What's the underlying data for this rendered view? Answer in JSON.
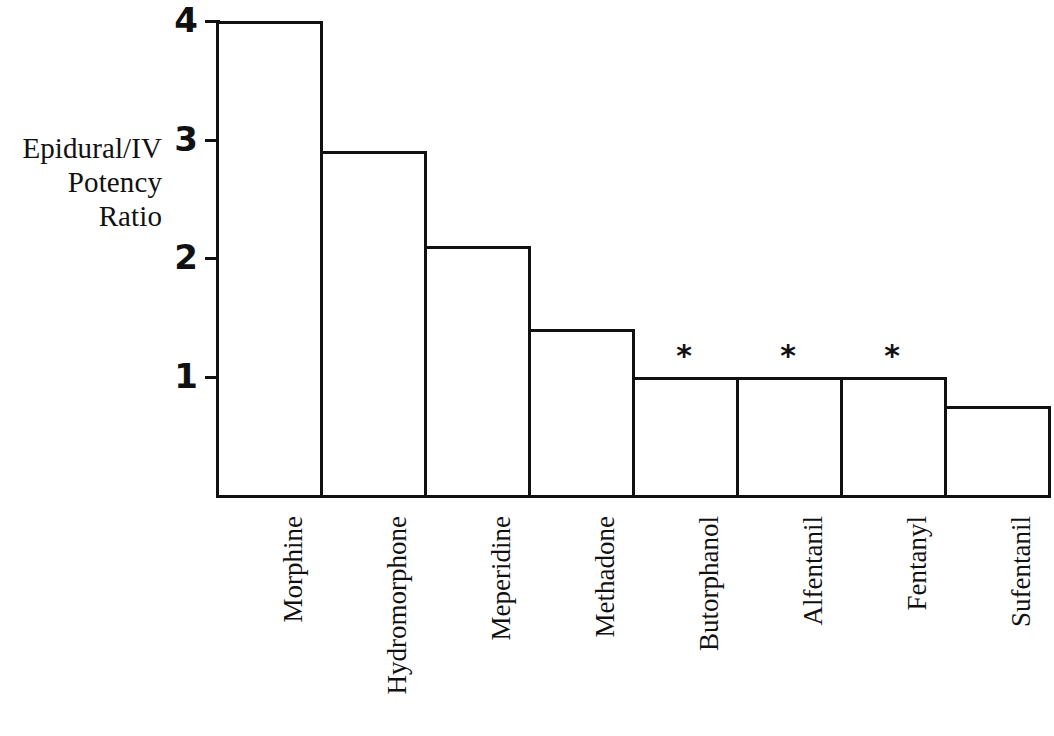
{
  "chart_data": {
    "type": "bar",
    "title": "",
    "subtitle": "",
    "xlabel": "",
    "ylabel": "Epidural/IV Potency Ratio",
    "ylabel_lines": [
      "Epidural/IV",
      "Potency",
      "Ratio"
    ],
    "categories": [
      "Morphine",
      "Hydromorphone",
      "Meperidine",
      "Methadone",
      "Butorphanol",
      "Alfentanil",
      "Fentanyl",
      "Sufentanil"
    ],
    "values": [
      4.0,
      2.9,
      2.1,
      1.4,
      1.0,
      1.0,
      1.0,
      0.75
    ],
    "annotations": [
      {
        "category": "Butorphanol",
        "marker": "*"
      },
      {
        "category": "Alfentanil",
        "marker": "*"
      },
      {
        "category": "Fentanyl",
        "marker": "*"
      }
    ],
    "ylim": [
      0,
      4
    ],
    "yticks": [
      1,
      2,
      3,
      4
    ],
    "ytick_labels": [
      "1",
      "2",
      "3",
      "4"
    ],
    "grid": false,
    "legend": null,
    "bar_fill_color": "#ffffff",
    "bar_edge_color": "#111111",
    "text_color": "#111111",
    "background_color": "#ffffff"
  }
}
